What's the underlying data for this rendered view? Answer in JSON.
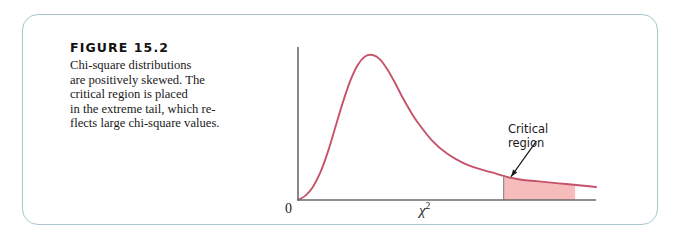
{
  "figure": {
    "number_label": "FIGURE 15.2",
    "caption_lines": [
      "Chi-square distributions",
      "are positively skewed. The",
      "critical region is placed",
      "in the extreme tail, which re-",
      "flects large chi-square values."
    ],
    "caption_full": "Chi-square distributions are positively skewed. The critical region is placed in the extreme tail, which reflects large chi-square values."
  },
  "chart_data": {
    "type": "line",
    "xlabel": "χ²",
    "ylabel": "",
    "xlim": [
      0,
      10
    ],
    "ylim": [
      0,
      1
    ],
    "grid": false,
    "legend": "none",
    "series": [
      {
        "name": "chi-square density",
        "color": "#c4536b",
        "x": [
          0.0,
          0.25,
          0.5,
          0.75,
          1.0,
          1.25,
          1.5,
          1.75,
          2.0,
          2.25,
          2.5,
          2.75,
          3.0,
          3.25,
          3.5,
          3.75,
          4.0,
          4.5,
          5.0,
          5.5,
          6.0,
          6.5,
          7.0,
          7.5,
          8.0,
          8.5,
          9.0,
          9.5,
          10.0
        ],
        "y": [
          0.0,
          0.03,
          0.09,
          0.19,
          0.33,
          0.5,
          0.67,
          0.82,
          0.93,
          0.99,
          1.0,
          0.97,
          0.9,
          0.81,
          0.71,
          0.62,
          0.54,
          0.41,
          0.32,
          0.26,
          0.22,
          0.19,
          0.16,
          0.14,
          0.13,
          0.12,
          0.11,
          0.1,
          0.09
        ]
      }
    ],
    "annotations": [
      {
        "name": "critical-region",
        "label_lines": [
          "Critical",
          "region"
        ],
        "label_text": "Critical region",
        "shade_color": "#f6bcbc",
        "x_start": 6.9,
        "x_end": 9.3,
        "leader_from_x": 8.0,
        "leader_to_x": 7.15
      }
    ],
    "axis_ticks": {
      "x": [
        {
          "value": 0,
          "label": "0"
        },
        {
          "value": 5.0,
          "label": "χ²"
        }
      ],
      "y": []
    },
    "axis_color": "#6a6a6a"
  }
}
